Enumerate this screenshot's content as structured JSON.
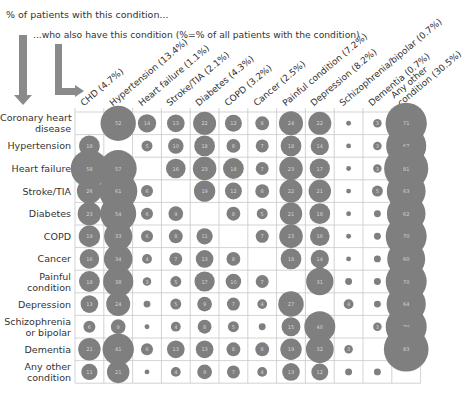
{
  "header": {
    "line1": "% of patients with this condition...",
    "line2": "...who also have this condition (%=% of all patients with the condition)"
  },
  "colors": {
    "bubble": "#7f7f7f",
    "grid": "#c8c8c8",
    "bubble_text": "#d6d6d6",
    "arrow": "#8a8a8a"
  },
  "chart_data": {
    "type": "bubble-matrix",
    "subtitle": "(%=% of all patients with the condition)",
    "rows": [
      "Coronary heart disease",
      "Hypertension",
      "Heart failure",
      "Stroke/TIA",
      "Diabetes",
      "COPD",
      "Cancer",
      "Painful condition",
      "Depression",
      "Schizophrenia or bipolar",
      "Dementia",
      "Any other condition"
    ],
    "row_labels_display": [
      [
        "Coronary heart",
        "disease"
      ],
      [
        "Hypertension"
      ],
      [
        "Heart failure"
      ],
      [
        "Stroke/TIA"
      ],
      [
        "Diabetes"
      ],
      [
        "COPD"
      ],
      [
        "Cancer"
      ],
      [
        "Painful",
        "condition"
      ],
      [
        "Depression"
      ],
      [
        "Schizophrenia",
        "or bipolar"
      ],
      [
        "Dementia"
      ],
      [
        "Any other",
        "condition"
      ]
    ],
    "columns": [
      "CHD (4.7%)",
      "Hypertension (13.4%)",
      "Heart failure (1.1%)",
      "Stroke/TIA (2.1%)",
      "Diabetes (4.3%)",
      "COPD (3.2%)",
      "Cancer (2.5%)",
      "Painful condition (7.2%)",
      "Depression (8.2%)",
      "Schizophrenia/bipolar (0.7%)",
      "Dementia (0.7%)",
      "Any other condition (30.5%)"
    ],
    "column_labels_display": [
      [
        "CHD (4.7%)"
      ],
      [
        "Hypertension (13.4%)"
      ],
      [
        "Heart failure (1.1%)"
      ],
      [
        "Stroke/TIA (2.1%)"
      ],
      [
        "Diabetes (4.3%)"
      ],
      [
        "COPD (3.2%)"
      ],
      [
        "Cancer (2.5%)"
      ],
      [
        "Painful condition (7.2%)"
      ],
      [
        "Depression (8.2%)"
      ],
      [
        "Schizophrenia/bipolar (0.7%)"
      ],
      [
        "Dementia (0.7%)"
      ],
      [
        "Any other",
        "condition (30.5%)"
      ]
    ],
    "values": [
      [
        null,
        52,
        14,
        13,
        22,
        12,
        8,
        24,
        22,
        1,
        3,
        71
      ],
      [
        18,
        null,
        5,
        10,
        18,
        8,
        7,
        18,
        14,
        1,
        3,
        67
      ],
      [
        58,
        57,
        null,
        16,
        23,
        18,
        7,
        23,
        17,
        1,
        3,
        81
      ],
      [
        26,
        61,
        6,
        null,
        19,
        12,
        8,
        22,
        21,
        1,
        5,
        63
      ],
      [
        23,
        54,
        6,
        9,
        null,
        8,
        5,
        21,
        18,
        1,
        2,
        62
      ],
      [
        19,
        33,
        6,
        8,
        11,
        null,
        7,
        23,
        16,
        1,
        2,
        70
      ],
      [
        16,
        34,
        4,
        7,
        13,
        8,
        null,
        18,
        14,
        1,
        2,
        60
      ],
      [
        18,
        38,
        3,
        5,
        17,
        10,
        7,
        null,
        31,
        2,
        2,
        70
      ],
      [
        13,
        24,
        2,
        5,
        9,
        7,
        4,
        27,
        null,
        4,
        2,
        64
      ],
      [
        6,
        9,
        1,
        4,
        8,
        5,
        2,
        15,
        40,
        null,
        3,
        70
      ],
      [
        21,
        41,
        6,
        13,
        13,
        8,
        8,
        19,
        32,
        3,
        null,
        83
      ],
      [
        11,
        21,
        1,
        4,
        9,
        7,
        4,
        13,
        12,
        2,
        2,
        null
      ]
    ],
    "value_unit": "%",
    "xlabel": "...who also have this condition",
    "ylabel": "% of patients with this condition",
    "grid": true
  }
}
